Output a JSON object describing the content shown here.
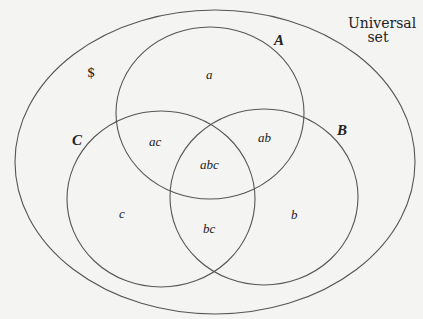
{
  "diagram": {
    "type": "venn",
    "universal_label_line1": "Universal",
    "universal_label_line2": "set",
    "universal_marker": "$",
    "stroke_color": "#555555",
    "background_color": "#f4f4f2",
    "sets": [
      {
        "name": "A",
        "label": "A"
      },
      {
        "name": "B",
        "label": "B"
      },
      {
        "name": "C",
        "label": "C"
      }
    ],
    "regions": {
      "a": "a",
      "b": "b",
      "c": "c",
      "ab": "ab",
      "ac": "ac",
      "bc": "bc",
      "abc": "abc"
    }
  }
}
